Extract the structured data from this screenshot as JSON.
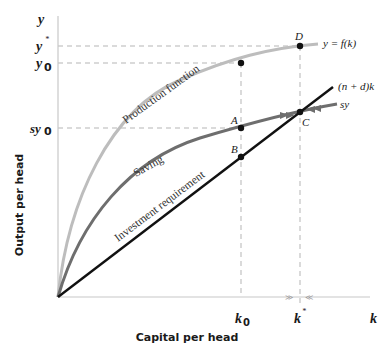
{
  "axes": {
    "y_axis_symbol": "y",
    "x_axis_symbol": "k",
    "y_axis_title": "Output per head",
    "x_axis_title": "Capital per head",
    "y_ticks": [
      {
        "label": "y",
        "sup": "*",
        "y": 46
      },
      {
        "label": "y",
        "sub": "0",
        "y": 63
      },
      {
        "label": "sy",
        "sub": "0",
        "y": 128
      }
    ],
    "x_ticks": [
      {
        "label": "k",
        "sub": "0",
        "x": 241
      },
      {
        "label": "k",
        "sup": "*",
        "x": 300
      }
    ]
  },
  "curves": {
    "production": {
      "label": "Production function",
      "eq": "y = f(k)",
      "color": "#bdbdbd"
    },
    "saving": {
      "label": "Saving",
      "eq": "sy",
      "color": "#6e6e6e"
    },
    "investment": {
      "label": "Investment requirement",
      "eq": "(n + d)k",
      "color": "#111111"
    }
  },
  "points": {
    "D": "D",
    "A": "A",
    "B": "B",
    "C": "C"
  },
  "arrows": {
    "right": "≫",
    "left": "≪"
  },
  "colors": {
    "dashed": "#b5b5b5",
    "axis": "#c8c8c8",
    "dot": "#111111"
  }
}
